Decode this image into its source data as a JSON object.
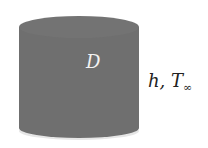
{
  "figure": {
    "shape": "cylinder",
    "fill_color": "#6f6f6f",
    "diameter_label": "D",
    "condition_label": "h, T",
    "condition_subscript": "∞"
  }
}
